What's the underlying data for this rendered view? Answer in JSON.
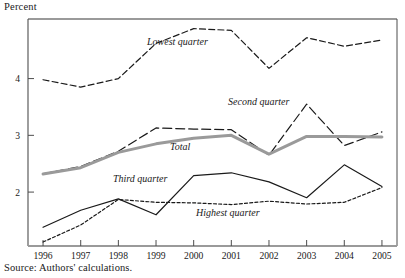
{
  "axis_label": {
    "y": "Percent"
  },
  "source_note": "Source: Authors' calculations.",
  "labels": {
    "lowest": "Lowest quarter",
    "second": "Second quarter",
    "total": "Total",
    "third": "Third quarter",
    "highest": "Highest quarter"
  },
  "colors": {
    "line": "#1a1a1a",
    "total": "#9a9a9a",
    "axis": "#8c8c8c",
    "frame": "#4d4d4d"
  },
  "chart_data": {
    "type": "line",
    "title": "",
    "xlabel": "",
    "ylabel": "Percent",
    "x": [
      1996,
      1997,
      1998,
      1999,
      2000,
      2001,
      2002,
      2003,
      2004,
      2005
    ],
    "xticklabels": [
      "1996",
      "1997",
      "1998",
      "1999",
      "2000",
      "2001",
      "2002",
      "2003",
      "2004",
      "2005"
    ],
    "yticks": [
      2,
      3,
      4
    ],
    "yticklabels": [
      "2",
      "3",
      "4"
    ],
    "ylim": [
      1.05,
      5.05
    ],
    "xlim": [
      1995.6,
      2005.4
    ],
    "grid": false,
    "legend": "inline-annotations",
    "series": [
      {
        "name": "Lowest quarter",
        "style": "dashed",
        "color": "#1a1a1a",
        "values": [
          3.98,
          3.85,
          4.0,
          4.62,
          4.88,
          4.85,
          4.18,
          4.72,
          4.57,
          4.68
        ]
      },
      {
        "name": "Second quarter",
        "style": "long-dashed",
        "color": "#1a1a1a",
        "values": [
          2.32,
          2.45,
          2.72,
          3.13,
          3.11,
          3.1,
          2.65,
          3.55,
          2.82,
          3.06
        ]
      },
      {
        "name": "Total",
        "style": "solid-thick-gray",
        "color": "#9a9a9a",
        "values": [
          2.32,
          2.43,
          2.7,
          2.85,
          2.95,
          3.0,
          2.67,
          2.98,
          2.98,
          2.97
        ]
      },
      {
        "name": "Third quarter",
        "style": "solid",
        "color": "#1a1a1a",
        "values": [
          1.38,
          1.68,
          1.88,
          1.6,
          2.29,
          2.34,
          2.18,
          1.9,
          2.48,
          2.1
        ]
      },
      {
        "name": "Highest quarter",
        "style": "dotted",
        "color": "#1a1a1a",
        "values": [
          1.12,
          1.42,
          1.87,
          1.82,
          1.81,
          1.78,
          1.84,
          1.79,
          1.82,
          2.08
        ]
      }
    ],
    "annotations": [
      {
        "text": "Lowest quarter",
        "x": 147,
        "y": 45
      },
      {
        "text": "Second quarter",
        "x": 228,
        "y": 105
      },
      {
        "text": "Total",
        "x": 170,
        "y": 150
      },
      {
        "text": "Third quarter",
        "x": 113,
        "y": 182
      },
      {
        "text": "Highest quarter",
        "x": 196,
        "y": 216
      }
    ]
  }
}
